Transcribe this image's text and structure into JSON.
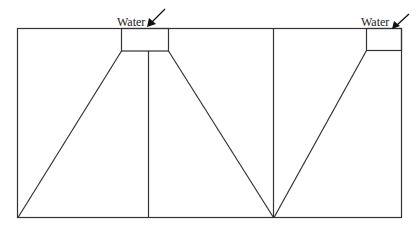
{
  "diagram": {
    "labels": {
      "water_left": "Water",
      "water_right": "Water"
    },
    "stroke_color": "#333333",
    "background": "#ffffff"
  }
}
